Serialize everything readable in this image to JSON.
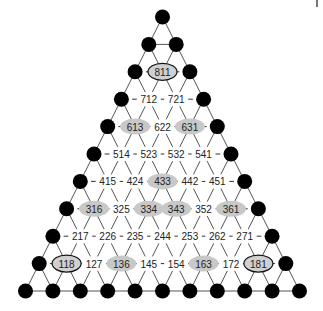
{
  "diagram": {
    "type": "triangular-lattice",
    "rows": 11,
    "apex": {
      "x": 162.5,
      "y": 17
    },
    "spacing_x": 27.4,
    "spacing_y": 27.4,
    "dot_radius": 7.5,
    "colors": {
      "dot": "#000000",
      "edge": "#555555",
      "shade": "#c8c8c8",
      "border": "#111111"
    },
    "label_rows": [
      {
        "row": 2,
        "labels": [
          "811"
        ]
      },
      {
        "row": 3,
        "labels": [
          "712",
          "721"
        ]
      },
      {
        "row": 4,
        "labels": [
          "613",
          "622",
          "631"
        ]
      },
      {
        "row": 5,
        "labels": [
          "514",
          "523",
          "532",
          "541"
        ]
      },
      {
        "row": 6,
        "labels": [
          "415",
          "424",
          "433",
          "442",
          "451"
        ]
      },
      {
        "row": 7,
        "labels": [
          "316",
          "325",
          "334",
          "343",
          "352",
          "361"
        ]
      },
      {
        "row": 8,
        "labels": [
          "217",
          "226",
          "235",
          "244",
          "253",
          "262",
          "271"
        ]
      },
      {
        "row": 9,
        "labels": [
          "118",
          "127",
          "136",
          "145",
          "154",
          "163",
          "172",
          "181"
        ]
      }
    ],
    "bordered_labels": [
      "811",
      "118",
      "181"
    ],
    "shaded_labels": [
      "613",
      "631",
      "433",
      "316",
      "334",
      "343",
      "361",
      "136",
      "163"
    ]
  }
}
